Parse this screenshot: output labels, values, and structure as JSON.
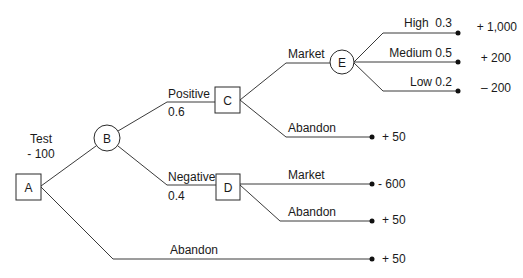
{
  "diagram": {
    "type": "decision-tree",
    "colors": {
      "line": "#3a3a3a",
      "text": "#1a1a1a",
      "background": "#ffffff"
    },
    "nodes": {
      "A": {
        "label": "A",
        "shape": "decision"
      },
      "B": {
        "label": "B",
        "shape": "chance"
      },
      "C": {
        "label": "C",
        "shape": "decision"
      },
      "D": {
        "label": "D",
        "shape": "decision"
      },
      "E": {
        "label": "E",
        "shape": "chance"
      }
    },
    "branches": {
      "a_test": {
        "label": "Test",
        "cost": "- 100"
      },
      "a_abandon": {
        "label": "Abandon",
        "payoff": "+ 50"
      },
      "b_positive": {
        "label": "Positive",
        "probability": "0.6"
      },
      "b_negative": {
        "label": "Negative",
        "probability": "0.4"
      },
      "c_market": {
        "label": "Market"
      },
      "c_abandon": {
        "label": "Abandon",
        "payoff": "+ 50"
      },
      "d_market": {
        "label": "Market",
        "payoff": "- 600"
      },
      "d_abandon": {
        "label": "Abandon",
        "payoff": "+ 50"
      },
      "e_high": {
        "label": "High  0.3",
        "payoff": "+ 1,000"
      },
      "e_medium": {
        "label": "Medium 0.5",
        "payoff": "+ 200"
      },
      "e_low": {
        "label": "Low 0.2",
        "payoff": "– 200"
      }
    }
  }
}
